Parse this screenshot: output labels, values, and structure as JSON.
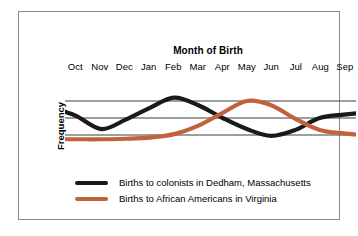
{
  "chart_data": {
    "type": "line",
    "title": "Month of Birth",
    "xlabel": "",
    "ylabel": "Frequency",
    "grid": true,
    "gridlines": 3,
    "legend_position": "bottom-left",
    "categories": [
      "Oct",
      "Nov",
      "Dec",
      "Jan",
      "Feb",
      "Mar",
      "Apr",
      "May",
      "Jun",
      "Jul",
      "Aug",
      "Sep"
    ],
    "ylim": [
      0,
      4
    ],
    "yticks": [
      1,
      2,
      3
    ],
    "ytick_labels": [
      "",
      "",
      ""
    ],
    "series": [
      {
        "name": "Births to colonists in Dedham, Massachusetts",
        "color": "#1a1a1a",
        "values": [
          2.1,
          1.35,
          1.9,
          2.6,
          3.2,
          2.75,
          2.0,
          1.35,
          0.95,
          1.3,
          2.0,
          2.2
        ]
      },
      {
        "name": "Births to African Americans in Virginia",
        "color": "#c0623a",
        "values": [
          0.75,
          0.75,
          0.78,
          0.85,
          1.05,
          1.55,
          2.3,
          3.0,
          2.75,
          1.95,
          1.3,
          1.1
        ]
      }
    ]
  },
  "legend": {
    "items": [
      {
        "label": "Births to colonists in Dedham, Massachusetts",
        "color": "#1a1a1a"
      },
      {
        "label": "Births to African Americans in Virginia",
        "color": "#c0623a"
      }
    ]
  },
  "colors": {
    "series_black": "#1a1a1a",
    "series_orange": "#c0623a",
    "gridline": "#3c3c3c",
    "frame_border": "#8a8a8a",
    "background": "#ffffff",
    "text": "#000000"
  }
}
